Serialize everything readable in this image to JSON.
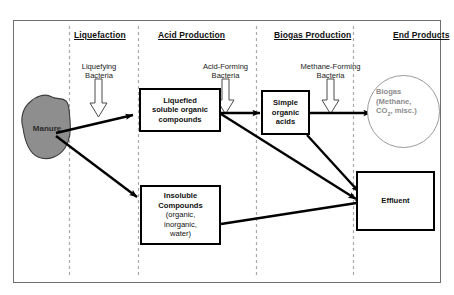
{
  "diagram": {
    "background_color": "#ffffff",
    "border_color": "#6f6f6f",
    "divider_color": "#a8a8a8",
    "arrow_color": "#000000",
    "manure_fill": "#8e8e8e",
    "biogas_text_color": "#8d8d8d",
    "biogas_circle_color": "#9a9a9a"
  },
  "stages": [
    {
      "id": "liquefaction",
      "label": "Liquefaction"
    },
    {
      "id": "acid-production",
      "label": "Acid Production"
    },
    {
      "id": "biogas-production",
      "label": "Biogas Production"
    },
    {
      "id": "end-products",
      "label": "End Products"
    }
  ],
  "bacteria": [
    {
      "id": "liquefying",
      "line1": "Liquefying",
      "line2": "Bacteria"
    },
    {
      "id": "acid-forming",
      "line1": "Acid-Forming",
      "line2": "Bacteria"
    },
    {
      "id": "methane-forming",
      "line1": "Methane-Forming",
      "line2": "Bacteria"
    }
  ],
  "nodes": {
    "manure": {
      "label": "Manure"
    },
    "liquefied": {
      "line1": "Liquefied",
      "line2": "soluble organic",
      "line3": "compounds"
    },
    "simple_acids": {
      "line1": "Simple",
      "line2": "organic",
      "line3": "acids"
    },
    "insoluble": {
      "line1": "Insoluble",
      "line2": "Compounds",
      "line3": "(organic,",
      "line4": "inorganic,",
      "line5": "water)"
    },
    "effluent": {
      "label": "Effluent"
    },
    "biogas": {
      "line1": "Biogas",
      "line2": "(Methane,",
      "line3_pre": "CO",
      "line3_sub": "2",
      "line3_post": ", misc.)"
    }
  }
}
